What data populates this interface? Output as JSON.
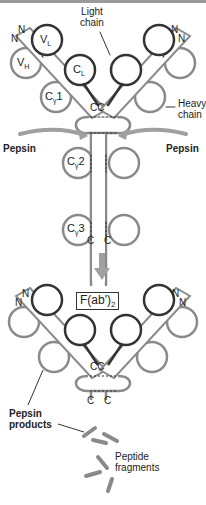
{
  "diagram": {
    "top_antibody": {
      "labels": {
        "light_chain": "Light\nchain",
        "light_chain_line1": "Light",
        "light_chain_line2": "chain",
        "heavy_chain_line1": "Heavy",
        "heavy_chain_line2": "chain",
        "n_terminal": "N",
        "c_terminal": "C",
        "hinge_disulfide": "CC"
      },
      "domains": {
        "vl": "V",
        "vl_sub": "L",
        "vh": "V",
        "vh_sub": "H",
        "cl": "C",
        "cl_sub": "L",
        "cg1": "C",
        "cg1_sub": "γ",
        "cg1_num": "1",
        "cg2": "C",
        "cg2_sub": "γ",
        "cg2_num": "2",
        "cg3": "C",
        "cg3_sub": "γ",
        "cg3_num": "3"
      },
      "enzyme_left": "Pepsin",
      "enzyme_right": "Pepsin"
    },
    "bottom_product": {
      "fragment_label": "F(ab')",
      "fragment_sub": "2",
      "hinge_disulfide": "CC",
      "n_terminal": "N",
      "c_terminal": "C",
      "pepsin_products_line1": "Pepsin",
      "pepsin_products_line2": "products",
      "peptide_fragments_line1": "Peptide",
      "peptide_fragments_line2": "fragments"
    },
    "colors": {
      "light_chain": "#333333",
      "heavy_chain": "#8a8a8a",
      "arrow": "#a0a0a0",
      "text": "#222222"
    }
  }
}
